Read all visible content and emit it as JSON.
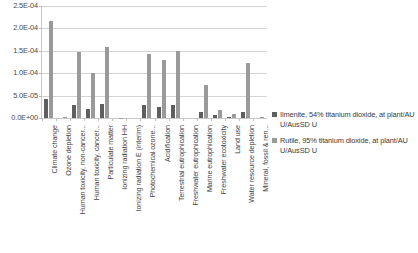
{
  "chart_data": {
    "type": "bar",
    "title": "",
    "xlabel": "",
    "ylabel": "",
    "ylim": [
      0,
      0.00025
    ],
    "grid": true,
    "legend_position": "right",
    "ytick_labels": [
      "2.5E-04",
      "2.0E-04",
      "1.5E-04",
      "1.0E-04",
      "5.0E-05",
      "0.0E+00"
    ],
    "ytick_values": [
      0.00025,
      0.0002,
      0.00015,
      0.0001,
      5e-05,
      0
    ],
    "categories": [
      "Climate change",
      "Ozone depletion",
      "Human toxicity, non-cancer...",
      "Human toxicity, cancer...",
      "Particulate matter",
      "Ionizing radiation HH",
      "Ionizing radiation E (interim)",
      "Photochemical ozone...",
      "Acidification",
      "Terrestrial eutrophication",
      "Freshwater eutrophication",
      "Marine eutrophication",
      "Freshwater ecotoxicity",
      "Land use",
      "Water resource depletion",
      "Mineral, fossil & ren..."
    ],
    "series": [
      {
        "name": "Ilmenite, 54% titanium dioxide, at plant/AU U/AusSD U",
        "color": "#5f5f5f",
        "values": [
          4.3e-05,
          0.0,
          2.9e-05,
          2.05e-05,
          3.2e-05,
          0.0,
          0.0,
          2.9e-05,
          2.55e-05,
          2.95e-05,
          0.0,
          1.25e-05,
          6.5e-06,
          3e-06,
          1.25e-05,
          0.0
        ]
      },
      {
        "name": "Rutile, 95% titanium dioxide, at plant/AU U/AusSD U",
        "color": "#9a9a9a",
        "values": [
          0.0002165,
          1.5e-06,
          0.000148,
          9.95e-05,
          0.0001595,
          1e-06,
          0.0,
          0.000142,
          0.000129,
          0.0001495,
          0.0,
          7.4e-05,
          1.8e-05,
          9e-06,
          0.0001235,
          2.5e-06
        ]
      }
    ]
  },
  "legend": {
    "items": [
      {
        "label": "Ilmenite, 54% titanium dioxide, at plant/AU U/AusSD U"
      },
      {
        "label": "Rutile, 95% titanium dioxide, at plant/AU U/AusSD U"
      }
    ]
  },
  "caption": {
    "text": ""
  }
}
